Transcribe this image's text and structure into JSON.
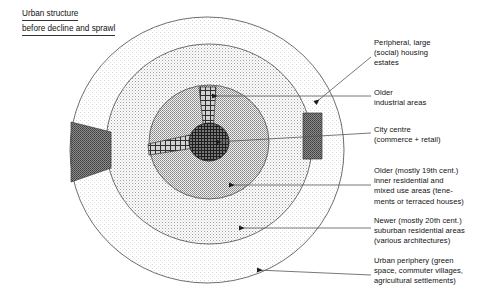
{
  "title": {
    "line1": "Urban structure",
    "line2": "before decline and sprawl"
  },
  "colors": {
    "outline": "#4a4a4a",
    "leader": "#555555",
    "text": "#111111",
    "ring_periphery": "#fbfbfb",
    "ring_suburban": "#e6e6e6",
    "ring_inner": "#bdbdbd",
    "city_centre": "#4a4a4a",
    "industrial": "#6e6e6e",
    "estates": "#9a9a9a"
  },
  "callouts": [
    {
      "id": "peripheral-housing-estates",
      "lines": [
        "Peripheral, large",
        "(social) housing",
        "estates"
      ]
    },
    {
      "id": "older-industrial-areas",
      "lines": [
        "Older",
        "industrial areas"
      ]
    },
    {
      "id": "city-centre",
      "lines": [
        "City centre",
        "(commerce + retail)"
      ]
    },
    {
      "id": "older-inner-residential",
      "lines": [
        "Older (mostly 19th cent.)",
        "inner residential and",
        "mixed use areas (tene-",
        "ments or terraced houses)"
      ]
    },
    {
      "id": "newer-suburban-residential",
      "lines": [
        "Newer (mostly 20th cent.)",
        "suburban residential areas",
        "(various architectures)"
      ]
    },
    {
      "id": "urban-periphery",
      "lines": [
        "Urban periphery (green",
        "space, commuter villages,",
        "agricultural settlements)"
      ]
    }
  ],
  "zones": [
    {
      "id": "urban-periphery-ring",
      "label": "Urban periphery"
    },
    {
      "id": "suburban-residential-ring",
      "label": "Newer suburban residential areas"
    },
    {
      "id": "inner-residential-ring",
      "label": "Older inner residential and mixed use areas"
    },
    {
      "id": "city-centre-core",
      "label": "City centre"
    },
    {
      "id": "industrial-area-left",
      "label": "Older industrial area (west)"
    },
    {
      "id": "industrial-area-right",
      "label": "Older industrial area (east)"
    },
    {
      "id": "housing-estate-north",
      "label": "Peripheral large social housing estate (north)"
    },
    {
      "id": "housing-estate-west",
      "label": "Peripheral large social housing estate (west)"
    }
  ]
}
